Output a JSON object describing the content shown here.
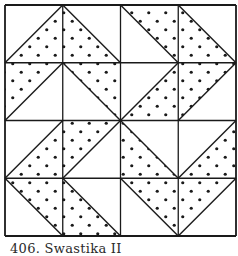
{
  "figure": {
    "caption": "406. Swastika II",
    "grid": {
      "rows": 4,
      "cols": 4,
      "origin_x": 5,
      "origin_y": 5,
      "cell_size": 57.75
    },
    "colors": {
      "line": "#1a1a1a",
      "dot": "#1a1a1a",
      "background": "#ffffff"
    },
    "dot_pattern": {
      "spacing": 8.5,
      "radius": 1.5
    },
    "cells": [
      {
        "row": 0,
        "col": 0,
        "diagonal": "/",
        "shaded": "lower-right"
      },
      {
        "row": 0,
        "col": 1,
        "diagonal": "\\",
        "shaded": "lower-left"
      },
      {
        "row": 0,
        "col": 2,
        "diagonal": "\\",
        "shaded": "upper-right"
      },
      {
        "row": 0,
        "col": 3,
        "diagonal": "\\",
        "shaded": "lower-left"
      },
      {
        "row": 1,
        "col": 0,
        "diagonal": "/",
        "shaded": "upper-left"
      },
      {
        "row": 1,
        "col": 1,
        "diagonal": "\\",
        "shaded": "upper-right"
      },
      {
        "row": 1,
        "col": 2,
        "diagonal": "/",
        "shaded": "lower-right"
      },
      {
        "row": 1,
        "col": 3,
        "diagonal": "/",
        "shaded": "upper-left"
      },
      {
        "row": 2,
        "col": 0,
        "diagonal": "/",
        "shaded": "lower-right"
      },
      {
        "row": 2,
        "col": 1,
        "diagonal": "/",
        "shaded": "upper-left"
      },
      {
        "row": 2,
        "col": 2,
        "diagonal": "\\",
        "shaded": "lower-left"
      },
      {
        "row": 2,
        "col": 3,
        "diagonal": "/",
        "shaded": "lower-right"
      },
      {
        "row": 3,
        "col": 0,
        "diagonal": "\\",
        "shaded": "upper-right"
      },
      {
        "row": 3,
        "col": 1,
        "diagonal": "\\",
        "shaded": "lower-left"
      },
      {
        "row": 3,
        "col": 2,
        "diagonal": "\\",
        "shaded": "upper-right"
      },
      {
        "row": 3,
        "col": 3,
        "diagonal": "/",
        "shaded": "upper-left"
      }
    ]
  }
}
